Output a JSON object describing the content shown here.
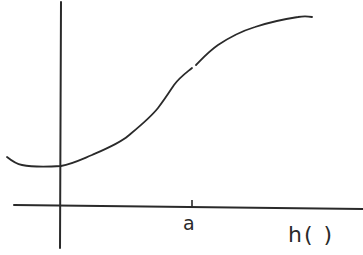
{
  "figure": {
    "type": "hand-drawn function sketch",
    "curve_shape": "s-shaped increasing curve with shallow minimum near the vertical axis",
    "tick_label": "a",
    "x_axis_label": "h( )",
    "colors": {
      "ink": "#2a2a2a",
      "background": "#ffffff"
    }
  }
}
